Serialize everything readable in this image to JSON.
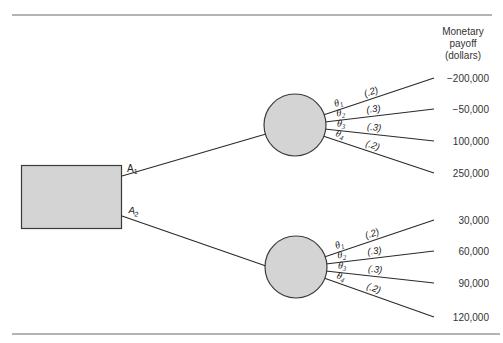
{
  "diagram": {
    "type": "decision-tree",
    "payoff_header": [
      "Monetary",
      "payoff",
      "(dollars)"
    ],
    "decision_node": {
      "label": "decision"
    },
    "branches": [
      {
        "action": "A",
        "action_sub": "1",
        "chance_outcomes": [
          {
            "state": "θ",
            "state_sub": "1",
            "prob": "(.2)",
            "payoff": "−200,000"
          },
          {
            "state": "θ",
            "state_sub": "2",
            "prob": "(.3)",
            "payoff": "−50,000"
          },
          {
            "state": "θ",
            "state_sub": "3",
            "prob": "(.3)",
            "payoff": "100,000"
          },
          {
            "state": "θ",
            "state_sub": "4",
            "prob": "(.2)",
            "payoff": "250,000"
          }
        ]
      },
      {
        "action": "A",
        "action_sub": "2",
        "chance_outcomes": [
          {
            "state": "θ",
            "state_sub": "1",
            "prob": "(.2)",
            "payoff": "30,000"
          },
          {
            "state": "θ",
            "state_sub": "2",
            "prob": "(.3)",
            "payoff": "60,000"
          },
          {
            "state": "θ",
            "state_sub": "3",
            "prob": "(.3)",
            "payoff": "90,000"
          },
          {
            "state": "θ",
            "state_sub": "4",
            "prob": "(.2)",
            "payoff": "120,000"
          }
        ]
      }
    ]
  },
  "colors": {
    "node_fill": "#d4d4d4",
    "stroke": "#2a2a2a",
    "rule": "#9a9a9a"
  }
}
